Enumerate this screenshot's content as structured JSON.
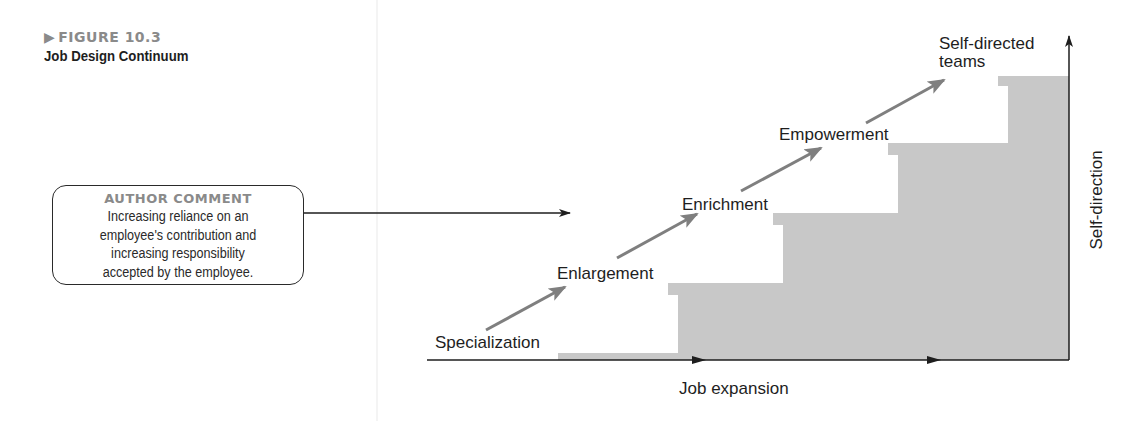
{
  "figure": {
    "number_label": "FIGURE 10.3",
    "title": "Job Design Continuum"
  },
  "author_comment": {
    "heading": "AUTHOR COMMENT",
    "lines": [
      "Increasing reliance on an",
      "employee's contribution and",
      "increasing responsibility",
      "accepted by the employee."
    ]
  },
  "diagram": {
    "stages": [
      {
        "label": "Specialization",
        "level": 1
      },
      {
        "label": "Enlargement",
        "level": 2
      },
      {
        "label": "Enrichment",
        "level": 3
      },
      {
        "label": "Empowerment",
        "level": 4
      },
      {
        "label": "Self-directed teams",
        "label_lines": [
          "Self-directed",
          "teams"
        ],
        "level": 5
      }
    ],
    "x_axis_label": "Job expansion",
    "y_axis_label": "Self-direction",
    "colors": {
      "step_fill": "#c8c8c8",
      "arrow_gray": "#7f7f7f",
      "axis": "#1e1e1e",
      "figure_label": "#8a8a8a"
    }
  }
}
